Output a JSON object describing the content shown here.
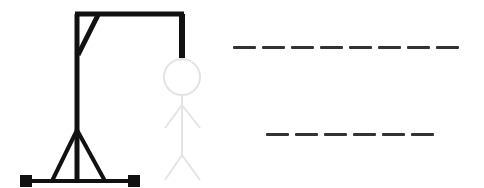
{
  "game": {
    "title": "Hangman",
    "colors": {
      "gallows": "#111111",
      "figure": "#e4e4e4",
      "slot": "#333333"
    },
    "wrong_guesses_shown": 6,
    "figure_parts": [
      "head",
      "body",
      "left-arm",
      "right-arm",
      "left-leg",
      "right-leg"
    ]
  },
  "words": [
    {
      "letters": 8,
      "slots": [
        "",
        "",
        "",
        "",
        "",
        "",
        "",
        ""
      ]
    },
    {
      "letters": 6,
      "slots": [
        "",
        "",
        "",
        "",
        "",
        ""
      ]
    }
  ]
}
